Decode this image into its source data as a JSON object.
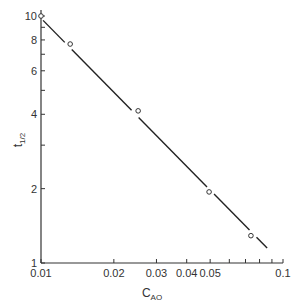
{
  "chart_data": {
    "type": "scatter",
    "title": "",
    "xlabel": "C_AO",
    "ylabel": "t_1/2",
    "xlabel_main": "C",
    "xlabel_sub": "AO",
    "ylabel_main": "t",
    "ylabel_sub": "1/2",
    "xscale": "log",
    "yscale": "log",
    "xlim": [
      0.01,
      0.1
    ],
    "ylim": [
      1,
      10
    ],
    "grid": false,
    "legend": null,
    "x_ticks": [
      0.01,
      0.02,
      0.03,
      0.04,
      0.05,
      0.1
    ],
    "x_tick_labels": [
      "0.01",
      "0.02",
      "0.03",
      "0.04",
      "0.05",
      "0.1"
    ],
    "x_minor_ticks": [
      0.06,
      0.07,
      0.08,
      0.09
    ],
    "y_ticks": [
      1,
      2,
      4,
      6,
      8,
      10
    ],
    "y_tick_labels": [
      "1",
      "2",
      "4",
      "6",
      "8",
      "10"
    ],
    "y_minor_ticks": [
      3,
      5,
      7,
      9
    ],
    "series": [
      {
        "name": "data",
        "marker": "open-circle",
        "x": [
          0.01,
          0.0132,
          0.0252,
          0.0495,
          0.0737
        ],
        "y": [
          10,
          7.7,
          4.13,
          1.94,
          1.29
        ]
      },
      {
        "name": "fit",
        "style": "line",
        "x": [
          0.0102,
          0.086
        ],
        "y": [
          9.6,
          1.15
        ]
      }
    ]
  }
}
